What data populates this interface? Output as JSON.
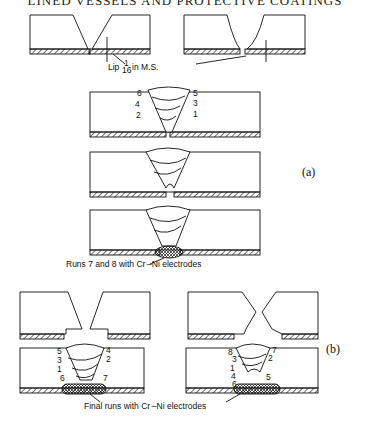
{
  "header": {
    "title": "LINED VESSELS AND PROTECTIVE COATINGS"
  },
  "figure_a": {
    "tag": "(a)",
    "lip_label": "Lip",
    "lip_fraction_num": "1",
    "lip_fraction_den": "16",
    "lip_unit": "in M.S.",
    "run_labels_left": [
      "6",
      "4",
      "2"
    ],
    "run_labels_right": [
      "5",
      "3",
      "1"
    ],
    "caption": "Runs 7 and 8 with Cr –Ni electrodes"
  },
  "figure_b": {
    "tag": "(b)",
    "left_labels": [
      "5",
      "3",
      "1",
      "6"
    ],
    "left_labels_right": [
      "4",
      "2",
      "7"
    ],
    "right_labels": [
      "8",
      "3",
      "1",
      "4",
      "6"
    ],
    "right_labels_right": [
      "7",
      "2",
      "5"
    ],
    "caption": "Final runs with Cr –Ni electrodes"
  }
}
